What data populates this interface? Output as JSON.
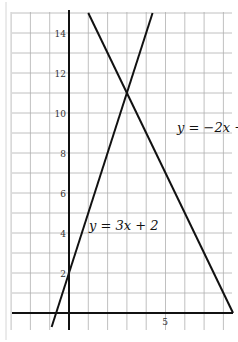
{
  "chart_data": {
    "type": "line",
    "title": "",
    "xlabel": "",
    "ylabel": "",
    "xlim": [
      -3,
      8.5
    ],
    "ylim": [
      -0.8,
      15
    ],
    "grid": true,
    "x_tick_labels": [
      {
        "value": 5,
        "label": "5"
      }
    ],
    "y_tick_labels": [
      {
        "value": 2,
        "label": "2"
      },
      {
        "value": 4,
        "label": "4"
      },
      {
        "value": 6,
        "label": "6"
      },
      {
        "value": 8,
        "label": "8"
      },
      {
        "value": 10,
        "label": "10"
      },
      {
        "value": 12,
        "label": "12"
      },
      {
        "value": 14,
        "label": "14"
      }
    ],
    "series": [
      {
        "name": "y = 3x + 2",
        "slope": 3,
        "intercept": 2,
        "x": [
          -0.9,
          0,
          1,
          2,
          3,
          4.33
        ],
        "y": [
          -0.7,
          2,
          5,
          8,
          11,
          15
        ]
      },
      {
        "name": "y = −2x + 17",
        "slope": -2,
        "intercept": 17,
        "x": [
          1,
          2,
          3,
          4,
          5,
          6,
          7,
          8,
          8.5
        ],
        "y": [
          15,
          13,
          11,
          9,
          7,
          5,
          3,
          1,
          0
        ]
      }
    ],
    "annotations": [
      {
        "text": "y = −2x + 17",
        "x": 5.6,
        "y": 9.2
      },
      {
        "text": "y = 3x + 2",
        "x": 1.1,
        "y": 4.3
      }
    ],
    "intersection": {
      "x": 3,
      "y": 11
    }
  },
  "labels": {
    "line1": "y = 3x + 2",
    "line2": "y = −2x + 17",
    "xtick5": "5",
    "ytick2": "2",
    "ytick4": "4",
    "ytick6": "6",
    "ytick8": "8",
    "ytick10": "10",
    "ytick12": "12",
    "ytick14": "14"
  }
}
